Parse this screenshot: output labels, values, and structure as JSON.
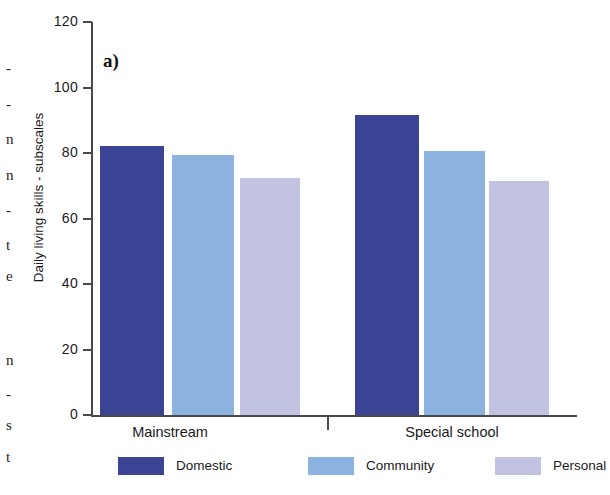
{
  "figure": {
    "panel_label": "a)"
  },
  "margin_text": {
    "chars": [
      "-",
      "-",
      "n",
      "n",
      "-",
      "t",
      "e",
      "n",
      "-",
      "s",
      "t"
    ],
    "tops": [
      60,
      96,
      131,
      167,
      202,
      237,
      268,
      352,
      386,
      417,
      449
    ]
  },
  "chart_data": {
    "type": "bar",
    "title": "a)",
    "xlabel": "",
    "ylabel": "Daily living skills - subscales",
    "categories": [
      "Mainstream",
      "Special school"
    ],
    "series": [
      {
        "name": "Domestic",
        "color": "#3b4395",
        "values": [
          82,
          91.5
        ]
      },
      {
        "name": "Community",
        "color": "#8cb3e0",
        "values": [
          79.5,
          80.5
        ]
      },
      {
        "name": "Personal",
        "color": "#c2c2e3",
        "values": [
          72.5,
          71.5
        ]
      }
    ],
    "ylim": [
      0,
      120
    ],
    "yticks": [
      0,
      20,
      40,
      60,
      80,
      100,
      120
    ],
    "ytick_labels": [
      "0",
      "20",
      "40",
      "60",
      "80",
      "100",
      "120"
    ],
    "grid": false,
    "legend_position": "below-axis"
  },
  "legend": {
    "items": [
      {
        "label": "Domestic",
        "color": "#3b4395"
      },
      {
        "label": "Community",
        "color": "#8cb3e0"
      },
      {
        "label": "Personal",
        "color": "#c2c2e3"
      }
    ]
  }
}
